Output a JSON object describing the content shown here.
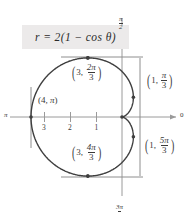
{
  "figure": {
    "equation": "r = 2(1 − cos θ)",
    "curve_name": "cardioid"
  },
  "axes": {
    "label_right": "0",
    "label_left": "π",
    "label_top_num": "π",
    "label_top_den": "2",
    "label_bottom_num": "3π",
    "label_bottom_den": "2",
    "ticks": [
      {
        "label": "3",
        "value": 3
      },
      {
        "label": "2",
        "value": 2
      },
      {
        "label": "1",
        "value": 1
      }
    ]
  },
  "points": [
    {
      "id": "p-pi-3",
      "r": "1",
      "theta_num": "π",
      "theta_den": "3"
    },
    {
      "id": "p-5pi-3",
      "r": "1",
      "theta_num": "5π",
      "theta_den": "3"
    },
    {
      "id": "p-2pi-3",
      "r": "3",
      "theta_num": "2π",
      "theta_den": "3"
    },
    {
      "id": "p-4pi-3",
      "r": "3",
      "theta_num": "4π",
      "theta_den": "3"
    },
    {
      "id": "p-pi",
      "r": "4",
      "theta_num": "π",
      "theta_den": ""
    }
  ],
  "colors": {
    "curve": "#3f3f3f",
    "axis": "#9a9a9a",
    "guide": "#8e8e8e",
    "text": "#3a3a3a",
    "box_bg": "#eceaea"
  },
  "chart_data": {
    "type": "line",
    "title": "r = 2(1 − cos θ)",
    "plot_kind": "polar-cardioid",
    "xlabel": "",
    "ylabel": "",
    "polar_axis_labels": {
      "theta_0": "0",
      "theta_pi": "π",
      "theta_half_pi": "π/2",
      "theta_3half_pi": "3π/2"
    },
    "radial_ticks": [
      1,
      2,
      3
    ],
    "rlim": [
      0,
      4
    ],
    "grid": false,
    "legend": null,
    "equation": "r = 2(1 - cos(theta))",
    "labeled_points": [
      {
        "r": 1,
        "theta": "pi/3",
        "label": "(1, π/3)"
      },
      {
        "r": 1,
        "theta": "5pi/3",
        "label": "(1, 5π/3)"
      },
      {
        "r": 3,
        "theta": "2pi/3",
        "label": "(3, 2π/3)"
      },
      {
        "r": 3,
        "theta": "4pi/3",
        "label": "(3, 4π/3)"
      },
      {
        "r": 4,
        "theta": "pi",
        "label": "(4, π)"
      },
      {
        "r": 0,
        "theta": "0",
        "label": "pole (cusp)"
      }
    ],
    "series": [
      {
        "name": "r = 2(1 - cos θ)",
        "theta_deg": [
          0,
          10,
          20,
          30,
          40,
          50,
          60,
          70,
          80,
          90,
          100,
          110,
          120,
          130,
          140,
          150,
          160,
          170,
          180,
          190,
          200,
          210,
          220,
          230,
          240,
          250,
          260,
          270,
          280,
          290,
          300,
          310,
          320,
          330,
          340,
          350,
          360
        ],
        "r": [
          0.0,
          0.03,
          0.12,
          0.27,
          0.47,
          0.71,
          1.0,
          1.32,
          1.65,
          2.0,
          2.35,
          2.68,
          3.0,
          3.29,
          3.53,
          3.73,
          3.88,
          3.97,
          4.0,
          3.97,
          3.88,
          3.73,
          3.53,
          3.29,
          3.0,
          2.68,
          2.35,
          2.0,
          1.65,
          1.32,
          1.0,
          0.71,
          0.47,
          0.27,
          0.12,
          0.03,
          0.0
        ]
      }
    ]
  }
}
